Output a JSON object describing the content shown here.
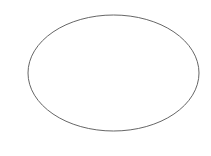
{
  "canvas": {
    "width": 211,
    "height": 156,
    "background": "#ffffff"
  },
  "shapes": [
    {
      "type": "ellipse",
      "cx": 113.5,
      "cy": 73,
      "rx": 85.5,
      "ry": 58,
      "stroke": "#666666",
      "stroke_width": 1,
      "fill": "none"
    }
  ]
}
